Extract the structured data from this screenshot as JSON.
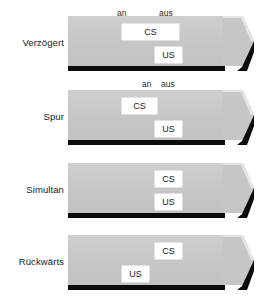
{
  "diagram": {
    "colors": {
      "bar_fill": "#c9c9c9",
      "bar_base": "#0b0b0b",
      "box_fill": "#ffffff",
      "text": "#1a1a1a",
      "background": "#ffffff"
    },
    "tick_labels": {
      "on": "an",
      "off": "aus"
    },
    "event_labels": {
      "cs": "CS",
      "us": "US"
    },
    "rows": [
      {
        "name": "verzoegert",
        "label": "Verzögert",
        "label_top": 37,
        "bar_top": 16,
        "ticks": [
          {
            "name": "tick-an",
            "text": "an",
            "left": 117,
            "top": 8
          },
          {
            "name": "tick-aus",
            "text": "aus",
            "left": 159,
            "top": 8
          }
        ],
        "events": [
          {
            "name": "cs-box",
            "text": "CS",
            "left": 122,
            "top": 24,
            "width": 57
          },
          {
            "name": "us-box",
            "text": "US",
            "left": 155,
            "top": 47,
            "width": 27
          }
        ]
      },
      {
        "name": "spur",
        "label": "Spur",
        "label_top": 111,
        "bar_top": 90,
        "ticks": [
          {
            "name": "tick-an",
            "text": "an",
            "left": 142,
            "top": 79
          },
          {
            "name": "tick-aus",
            "text": "aus",
            "left": 161,
            "top": 79
          }
        ],
        "events": [
          {
            "name": "cs-box",
            "text": "CS",
            "left": 122,
            "top": 98,
            "width": 35
          },
          {
            "name": "us-box",
            "text": "US",
            "left": 155,
            "top": 121,
            "width": 27
          }
        ]
      },
      {
        "name": "simultan",
        "label": "Simultan",
        "label_top": 184,
        "bar_top": 163,
        "ticks": [],
        "events": [
          {
            "name": "cs-box",
            "text": "CS",
            "left": 155,
            "top": 171,
            "width": 27
          },
          {
            "name": "us-box",
            "text": "US",
            "left": 155,
            "top": 194,
            "width": 27
          }
        ]
      },
      {
        "name": "rueckwaerts",
        "label": "Rückwärts",
        "label_top": 256,
        "bar_top": 235,
        "ticks": [],
        "events": [
          {
            "name": "cs-box",
            "text": "CS",
            "left": 155,
            "top": 243,
            "width": 27
          },
          {
            "name": "us-box",
            "text": "US",
            "left": 122,
            "top": 266,
            "width": 27
          }
        ]
      }
    ]
  }
}
